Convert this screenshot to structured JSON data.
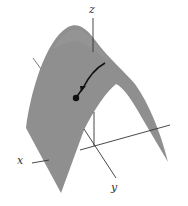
{
  "figure": {
    "axes": {
      "x_label": "x",
      "y_label": "y",
      "z_label": "z"
    },
    "colors": {
      "surface": "#8f8f8f",
      "surface_shade": "#9b9b9b",
      "axis": "#3a3a3a",
      "curve": "#111111",
      "background": "#ffffff"
    },
    "elements": {
      "surface": "parabolic-ridge-surface",
      "curve": "path-on-surface-with-arrow",
      "point": "starting-point-dot"
    }
  }
}
